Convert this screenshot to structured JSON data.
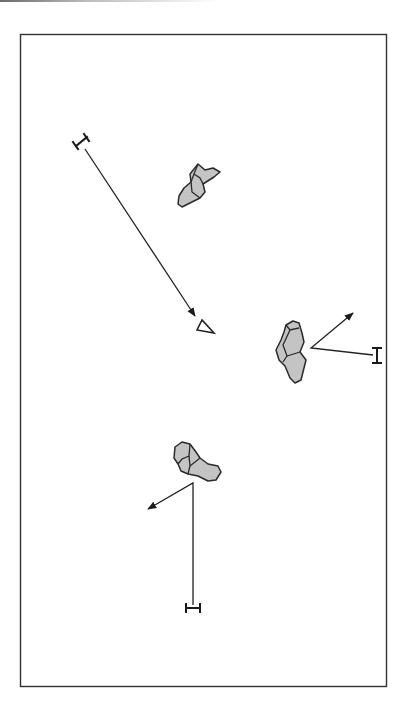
{
  "diagram": {
    "type": "movement-diagram",
    "frame": {
      "x": 20,
      "y": 34,
      "width": 367,
      "height": 653,
      "stroke": "#333333",
      "fill": "#ffffff"
    },
    "colors": {
      "blob_fill": "#c4c4c4",
      "line": "#222222"
    },
    "objects": [
      {
        "id": "blob-top",
        "shape": "irregular-blob",
        "center": [
          197,
          185
        ]
      },
      {
        "id": "blob-right",
        "shape": "irregular-blob",
        "center": [
          290,
          352
        ]
      },
      {
        "id": "blob-bottom",
        "shape": "irregular-blob",
        "center": [
          193,
          462
        ]
      }
    ],
    "paths": [
      {
        "id": "path-1",
        "start_marker": "i-beam",
        "start": [
          83,
          145
        ],
        "end": [
          195,
          317
        ],
        "end_marker": "arrowhead"
      },
      {
        "id": "path-2",
        "start_marker": "i-beam",
        "start": [
          375,
          354
        ],
        "via": [
          311,
          348
        ],
        "end": [
          353,
          313
        ],
        "end_marker": "arrowhead"
      },
      {
        "id": "path-3",
        "start_marker": "i-beam",
        "start": [
          193,
          607
        ],
        "via": [
          193,
          483
        ],
        "end": [
          148,
          509
        ],
        "end_marker": "arrowhead"
      }
    ],
    "markers": [
      {
        "id": "triangle-marker",
        "shape": "triangle",
        "position": [
          205,
          328
        ]
      }
    ]
  }
}
